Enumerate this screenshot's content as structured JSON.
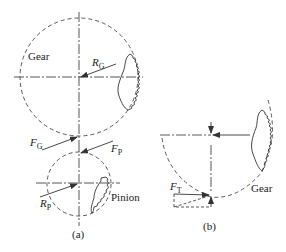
{
  "figure_a": {
    "caption": "(a)",
    "gear_label": "Gear",
    "pinion_label": "Pinion",
    "r_gear": {
      "base": "R",
      "sub": "G"
    },
    "r_pinion": {
      "base": "R",
      "sub": "P"
    },
    "f_gear": {
      "base": "F",
      "sub": "G"
    },
    "f_pinion": {
      "base": "F",
      "sub": "P"
    }
  },
  "figure_b": {
    "caption": "(b)",
    "gear_label": "Gear",
    "f_tangential": {
      "base": "F",
      "sub": "T"
    }
  },
  "colors": {
    "line": "#333333",
    "text": "#222222",
    "background": "#ffffff"
  }
}
